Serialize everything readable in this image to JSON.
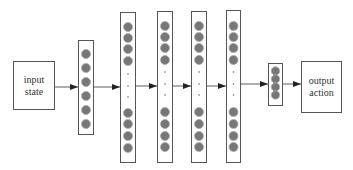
{
  "diagram": {
    "type": "neural-network-architecture",
    "input_box": {
      "line1": "input",
      "line2": "state",
      "x": 13,
      "y": 61,
      "w": 42,
      "h": 49
    },
    "output_box": {
      "line1": "output",
      "line2": "action",
      "x": 301,
      "y": 61,
      "w": 41,
      "h": 52
    },
    "colors": {
      "stroke": "#555555",
      "node_fill": "#777777",
      "node_ring": "#aaaaaa",
      "arrow": "#333333"
    },
    "layers": [
      {
        "name": "layer-1",
        "x": 78,
        "y": 40,
        "w": 15,
        "h": 94,
        "nodes": [
          54,
          68,
          82,
          96,
          110,
          124
        ],
        "dots": [],
        "r": 4.5
      },
      {
        "name": "layer-2",
        "x": 120,
        "y": 12,
        "w": 15,
        "h": 150,
        "nodes": [
          27,
          38,
          49,
          61,
          113,
          124,
          136,
          148
        ],
        "dots": [
          74,
          86,
          97
        ],
        "r": 4.5
      },
      {
        "name": "layer-3",
        "x": 157,
        "y": 11,
        "w": 15,
        "h": 151,
        "nodes": [
          26,
          37,
          48,
          60,
          112,
          124,
          136,
          147
        ],
        "dots": [
          72,
          84,
          95
        ],
        "r": 4.5
      },
      {
        "name": "layer-4",
        "x": 191,
        "y": 11,
        "w": 15,
        "h": 151,
        "nodes": [
          26,
          37,
          48,
          60,
          112,
          124,
          136,
          147
        ],
        "dots": [
          72,
          84,
          95
        ],
        "r": 4.5
      },
      {
        "name": "layer-5",
        "x": 226,
        "y": 10,
        "w": 14,
        "h": 152,
        "nodes": [
          26,
          37,
          48,
          60,
          112,
          124,
          136,
          147
        ],
        "dots": [
          72,
          84,
          95
        ],
        "r": 4.5
      },
      {
        "name": "layer-out",
        "x": 268,
        "y": 63,
        "w": 14,
        "h": 42,
        "nodes": [
          71,
          79,
          87,
          95
        ],
        "dots": [],
        "r": 4.2
      }
    ],
    "arrows": [
      {
        "x1": 55,
        "x2": 78,
        "y": 87
      },
      {
        "x1": 93,
        "x2": 120,
        "y": 87
      },
      {
        "x1": 135,
        "x2": 157,
        "y": 86
      },
      {
        "x1": 172,
        "x2": 191,
        "y": 86
      },
      {
        "x1": 206,
        "x2": 226,
        "y": 86
      },
      {
        "x1": 240,
        "x2": 268,
        "y": 84
      },
      {
        "x1": 282,
        "x2": 301,
        "y": 84
      }
    ]
  }
}
